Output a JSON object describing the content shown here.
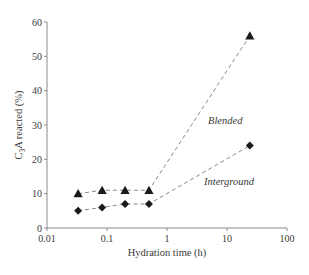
{
  "chart_data": {
    "type": "scatter",
    "title": "",
    "xlabel": "Hydration time (h)",
    "ylabel": "C3A reacted (%)",
    "ylabel_parts": {
      "pre": "C",
      "sub": "3",
      "post": "A reacted (%)"
    },
    "xscale": "log",
    "xlim": [
      0.01,
      100
    ],
    "ylim": [
      0,
      60
    ],
    "grid": false,
    "legend": "none (inline labels)",
    "x_ticks": [
      "0.01",
      "0.1",
      "1",
      "10",
      "100"
    ],
    "x_tick_values": [
      0.01,
      0.1,
      1,
      10,
      100
    ],
    "y_ticks": [
      "0",
      "10",
      "20",
      "30",
      "40",
      "50",
      "60"
    ],
    "y_tick_values": [
      0,
      10,
      20,
      30,
      40,
      50,
      60
    ],
    "series": [
      {
        "name": "Blended",
        "marker": "triangle",
        "line": "dashed",
        "x": [
          0.033,
          0.083,
          0.2,
          0.5,
          24
        ],
        "y": [
          10,
          11,
          11,
          11,
          56
        ],
        "label_pos": {
          "x": 208,
          "y": 124
        }
      },
      {
        "name": "Interground",
        "marker": "diamond",
        "line": "dashed",
        "x": [
          0.033,
          0.083,
          0.2,
          0.5,
          24
        ],
        "y": [
          5,
          6,
          7,
          7,
          24
        ],
        "label_pos": {
          "x": 204,
          "y": 185
        }
      }
    ],
    "colors": {
      "marker": "#1a1a1a",
      "line": "#7a7a7a",
      "axis": "#8a8a8a",
      "text": "#3a3a3a"
    }
  }
}
